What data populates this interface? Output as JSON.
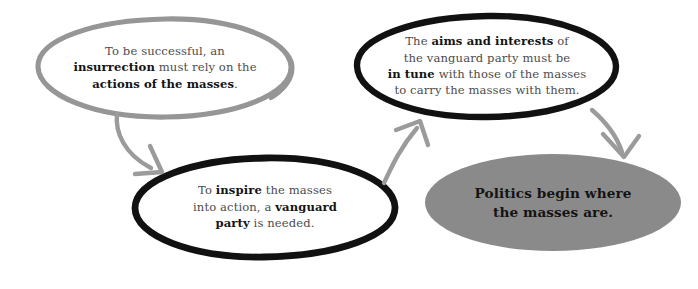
{
  "diagram": {
    "background": "#ffffff",
    "colors": {
      "gray_stroke": "#969696",
      "black_stroke": "#111111",
      "arrow_gray": "#9b9b9b",
      "fill_gray": "#8a8a8a",
      "body_text": "#4c4c4c",
      "bold_text": "#141414",
      "filled_text": "#111111"
    },
    "nodes": [
      {
        "id": "insurrection",
        "style": "outline-gray",
        "lines": [
          {
            "segments": [
              {
                "text": "To be successful, an",
                "bold": false
              }
            ]
          },
          {
            "segments": [
              {
                "text": "insurrection",
                "bold": true
              },
              {
                "text": " must rely on the",
                "bold": false
              }
            ]
          },
          {
            "segments": [
              {
                "text": "actions of the masses",
                "bold": true
              },
              {
                "text": ".",
                "bold": false
              }
            ]
          }
        ]
      },
      {
        "id": "aims-interests",
        "style": "outline-black",
        "lines": [
          {
            "segments": [
              {
                "text": "The ",
                "bold": false
              },
              {
                "text": "aims and interests",
                "bold": true
              },
              {
                "text": " of",
                "bold": false
              }
            ]
          },
          {
            "segments": [
              {
                "text": "the vanguard party must be",
                "bold": false
              }
            ]
          },
          {
            "segments": [
              {
                "text": "in tune",
                "bold": true
              },
              {
                "text": " with those of the masses",
                "bold": false
              }
            ]
          },
          {
            "segments": [
              {
                "text": "to carry the masses with them.",
                "bold": false
              }
            ]
          }
        ]
      },
      {
        "id": "vanguard-party",
        "style": "outline-black",
        "lines": [
          {
            "segments": [
              {
                "text": "To ",
                "bold": false
              },
              {
                "text": "inspire",
                "bold": true
              },
              {
                "text": " the masses",
                "bold": false
              }
            ]
          },
          {
            "segments": [
              {
                "text": "into action, a ",
                "bold": false
              },
              {
                "text": "vanguard",
                "bold": true
              }
            ]
          },
          {
            "segments": [
              {
                "text": "party",
                "bold": true
              },
              {
                "text": " is needed.",
                "bold": false
              }
            ]
          }
        ]
      },
      {
        "id": "politics-masses",
        "style": "filled-gray",
        "lines": [
          {
            "segments": [
              {
                "text": "Politics begin where",
                "bold": true
              }
            ]
          },
          {
            "segments": [
              {
                "text": "the masses are.",
                "bold": true
              }
            ]
          }
        ]
      }
    ],
    "arrows": [
      {
        "id": "insurrection-to-vanguard",
        "from": "insurrection",
        "to": "vanguard-party",
        "direction": "down-right"
      },
      {
        "id": "vanguard-to-aims",
        "from": "vanguard-party",
        "to": "aims-interests",
        "direction": "up-right"
      },
      {
        "id": "aims-to-politics",
        "from": "aims-interests",
        "to": "politics-masses",
        "direction": "down-right"
      }
    ]
  }
}
